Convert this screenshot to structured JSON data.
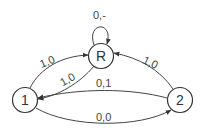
{
  "diagram": {
    "type": "state-machine",
    "nodes": [
      {
        "id": "R",
        "label": "R"
      },
      {
        "id": "1",
        "label": "1"
      },
      {
        "id": "2",
        "label": "2"
      }
    ],
    "edges": [
      {
        "from": "R",
        "to": "R",
        "label": "0,-"
      },
      {
        "from": "1",
        "to": "R",
        "label": "1,0"
      },
      {
        "from": "R",
        "to": "1",
        "label": "1,0"
      },
      {
        "from": "2",
        "to": "R",
        "label": "1,0"
      },
      {
        "from": "2",
        "to": "1",
        "label": "0,1"
      },
      {
        "from": "1",
        "to": "2",
        "label": "0,0"
      }
    ]
  }
}
